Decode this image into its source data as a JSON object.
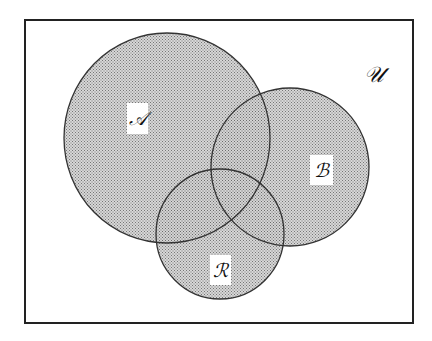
{
  "diagram": {
    "type": "venn",
    "universe": {
      "label": "𝒰",
      "frame": {
        "x": 25,
        "y": 20,
        "width": 388,
        "height": 303
      }
    },
    "sets": [
      {
        "id": "A",
        "label": "𝒜",
        "cx": 167,
        "cy": 138,
        "rx": 103,
        "ry": 105
      },
      {
        "id": "B",
        "label": "ℬ",
        "cx": 290,
        "cy": 167,
        "rx": 79,
        "ry": 79
      },
      {
        "id": "R",
        "label": "ℛ",
        "cx": 220,
        "cy": 234,
        "rx": 64,
        "ry": 65
      }
    ],
    "colors": {
      "fill_dots": "#555555",
      "fill_base": "#c8c8c8",
      "stroke": "#333333",
      "frame": "#222222",
      "background": "#ffffff"
    }
  }
}
